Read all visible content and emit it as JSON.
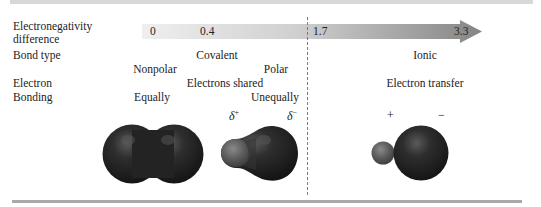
{
  "row_labels": {
    "en_diff_line1": "Electronegativity",
    "en_diff_line2": "difference",
    "bond_type": "Bond type",
    "electron_line1": "Electron",
    "electron_line2": "Bonding"
  },
  "scale": {
    "ticks": [
      "0",
      "0.4",
      "1.7",
      "3.3"
    ],
    "gradient_start": "#ececec",
    "gradient_end": "#8a8a8a"
  },
  "bond_types": {
    "covalent": "Covalent",
    "ionic": "Ionic",
    "nonpolar": "Nonpolar",
    "polar": "Polar"
  },
  "electron_behavior": {
    "shared": "Electrons shared",
    "equally": "Equally",
    "unequally": "Unequally",
    "transfer": "Electron transfer"
  },
  "charges": {
    "delta_symbol": "δ",
    "delta_plus_sign": "+",
    "delta_minus_sign": "−",
    "ionic_plus": "+",
    "ionic_minus": "−"
  },
  "molecules": [
    {
      "name": "nonpolar-covalent",
      "description": "Two equal spheres sharing electrons equally"
    },
    {
      "name": "polar-covalent",
      "description": "Small lighter lobe (δ+) and large dark lobe (δ−)"
    },
    {
      "name": "ionic",
      "description": "Small cation (+) next to large anion (−)"
    }
  ]
}
